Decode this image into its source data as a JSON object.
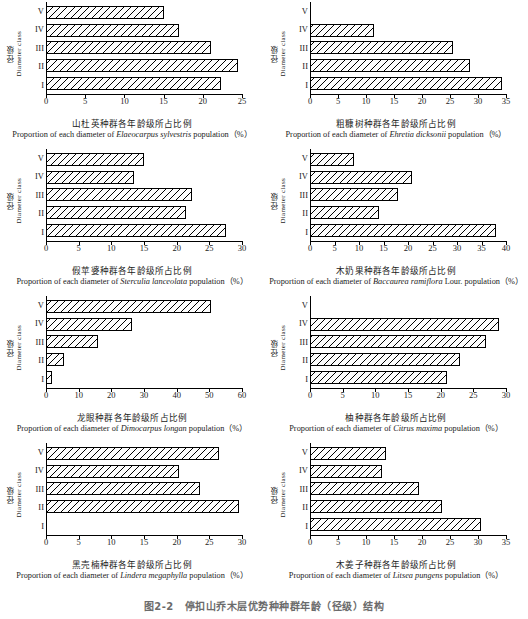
{
  "figure": {
    "caption_number": "图2-2",
    "caption_text": "停扣山乔木层优势种种群年龄（径级）结构",
    "y_axis_label_cn": "径级",
    "y_axis_label_en": "Diameter class",
    "class_labels": [
      "V",
      "IV",
      "III",
      "II",
      "I"
    ],
    "unit_label": "population（%）"
  },
  "chart_data": [
    {
      "type": "bar",
      "orientation": "horizontal",
      "index": 1,
      "title_cn": "山杜英种群各年龄级所占比例",
      "title_en_prefix": "Proportion of each diameter of ",
      "species": "Elaeocarpus sylvestris",
      "title_en_suffix": " population（%）",
      "ylabel_cn": "径级",
      "ylabel_en": "Diameter class",
      "categories": [
        "V",
        "IV",
        "III",
        "II",
        "I"
      ],
      "values": [
        15.0,
        17.0,
        21.0,
        24.5,
        22.3
      ],
      "xlim": [
        0,
        25
      ],
      "xticks": [
        0,
        5,
        10,
        15,
        20,
        25
      ],
      "xticklabels": [
        "0",
        "5",
        "10",
        "15",
        "20",
        "25"
      ]
    },
    {
      "type": "bar",
      "orientation": "horizontal",
      "index": 2,
      "title_cn": "粗糠树种群各年龄级所占比例",
      "title_en_prefix": "Proportion of each diameter of ",
      "species": "Ehretia dicksonii",
      "title_en_suffix": " population（%）",
      "ylabel_cn": "径级",
      "ylabel_en": "Diameter class",
      "categories": [
        "V",
        "IV",
        "III",
        "II",
        "I"
      ],
      "values": [
        0,
        11.5,
        25.5,
        28.5,
        34.3
      ],
      "xlim": [
        0,
        35
      ],
      "xticks": [
        0,
        5,
        10,
        15,
        20,
        25,
        30,
        35
      ],
      "xticklabels": [
        "0",
        "5",
        "10",
        "15",
        "20",
        "25",
        "30",
        "35"
      ]
    },
    {
      "type": "bar",
      "orientation": "horizontal",
      "index": 3,
      "title_cn": "假苹婆种群各年龄级所占比例",
      "title_en_prefix": "Proportion of each diameter of ",
      "species": "Sterculia lanceolata",
      "title_en_suffix": " population（%）",
      "ylabel_cn": "径级",
      "ylabel_en": "Diameter class",
      "categories": [
        "V",
        "IV",
        "III",
        "II",
        "I"
      ],
      "values": [
        15.0,
        13.4,
        22.4,
        21.4,
        27.5
      ],
      "xlim": [
        0,
        30
      ],
      "xticks": [
        0,
        5,
        10,
        15,
        20,
        25,
        30
      ],
      "xticklabels": [
        "0",
        "5",
        "10",
        "15",
        "20",
        "25",
        "30"
      ]
    },
    {
      "type": "bar",
      "orientation": "horizontal",
      "index": 4,
      "title_cn": "木奶果种群各年龄级所占比例",
      "title_en_prefix": "Proportion of each diameter of ",
      "species": "Baccaurea ramiflora",
      "title_en_suffix": " Lour. population（%）",
      "ylabel_cn": "径级",
      "ylabel_en": "Diameter class",
      "categories": [
        "V",
        "IV",
        "III",
        "II",
        "I"
      ],
      "values": [
        9.0,
        20.8,
        17.9,
        14.0,
        38.0
      ],
      "xlim": [
        0,
        40
      ],
      "xticks": [
        0,
        5,
        10,
        15,
        20,
        25,
        30,
        35,
        40
      ],
      "xticklabels": [
        "0",
        "5",
        "10",
        "15",
        "20",
        "25",
        "30",
        "35",
        "40"
      ]
    },
    {
      "type": "bar",
      "orientation": "horizontal",
      "index": 5,
      "title_cn": "龙眼种群各年龄级所占比例",
      "title_en_prefix": "Proportion of each diameter of ",
      "species": "Dimocarpus longan",
      "title_en_suffix": " population（%）",
      "ylabel_cn": "径级",
      "ylabel_en": "Diameter class",
      "categories": [
        "V",
        "IV",
        "III",
        "II",
        "I"
      ],
      "values": [
        50.5,
        26.2,
        15.8,
        5.4,
        1.7
      ],
      "xlim": [
        0,
        60
      ],
      "xticks": [
        0,
        10,
        20,
        30,
        40,
        50,
        60
      ],
      "xticklabels": [
        "0",
        "10",
        "20",
        "30",
        "40",
        "50",
        "60"
      ]
    },
    {
      "type": "bar",
      "orientation": "horizontal",
      "index": 6,
      "title_cn": "柚种群各年龄级所占比例",
      "title_en_prefix": "Proportion of each diameter of ",
      "species": "Citrus maxima",
      "title_en_suffix": " population（%）",
      "ylabel_cn": "径级",
      "ylabel_en": "Diameter class",
      "categories": [
        "V",
        "IV",
        "III",
        "II",
        "I"
      ],
      "values": [
        0,
        29.0,
        26.9,
        23.0,
        21.0
      ],
      "xlim": [
        0,
        30
      ],
      "xticks": [
        0,
        5,
        10,
        15,
        20,
        25,
        30
      ],
      "xticklabels": [
        "0",
        "5",
        "10",
        "15",
        "20",
        "25",
        "30"
      ]
    },
    {
      "type": "bar",
      "orientation": "horizontal",
      "index": 7,
      "title_cn": "黑壳楠种群各年龄级所占比例",
      "title_en_prefix": "Proportion of each diameter of ",
      "species": "Lindera megaphylla",
      "title_en_suffix": " population（%）",
      "ylabel_cn": "径级",
      "ylabel_en": "Diameter class",
      "categories": [
        "V",
        "IV",
        "III",
        "II",
        "I"
      ],
      "values": [
        26.5,
        20.4,
        23.6,
        29.6,
        0
      ],
      "xlim": [
        0,
        30
      ],
      "xticks": [
        0,
        5,
        10,
        15,
        20,
        25,
        30
      ],
      "xticklabels": [
        "0",
        "5",
        "10",
        "15",
        "20",
        "25",
        "30"
      ]
    },
    {
      "type": "bar",
      "orientation": "horizontal",
      "index": 8,
      "title_cn": "木姜子种群各年龄级所占比例",
      "title_en_prefix": "Proportion of each diameter of ",
      "species": "Litsea pungens",
      "title_en_suffix": " population（%）",
      "ylabel_cn": "径级",
      "ylabel_en": "Diameter class",
      "categories": [
        "V",
        "IV",
        "III",
        "II",
        "I"
      ],
      "values": [
        13.5,
        12.9,
        19.5,
        23.5,
        30.5
      ],
      "xlim": [
        0,
        35
      ],
      "xticks": [
        0,
        5,
        10,
        15,
        20,
        25,
        30,
        35
      ],
      "xticklabels": [
        "0",
        "5",
        "10",
        "15",
        "20",
        "25",
        "30",
        "35"
      ]
    }
  ]
}
